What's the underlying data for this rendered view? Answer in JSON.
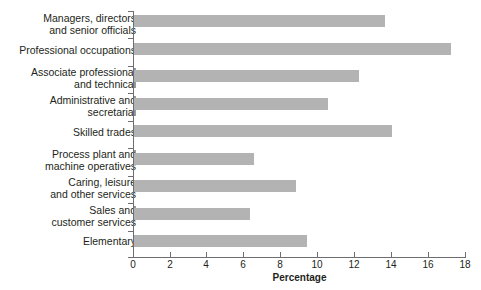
{
  "chart_data": {
    "type": "bar",
    "orientation": "horizontal",
    "title": "",
    "xlabel": "Percentage",
    "ylabel": "",
    "xlim": [
      0,
      18
    ],
    "xticks": [
      0,
      2,
      4,
      6,
      8,
      10,
      12,
      14,
      16,
      18
    ],
    "grid": false,
    "legend": null,
    "bar_color": "#b3b3b3",
    "axis_color": "#6d6e71",
    "categories": [
      "Managers, directors\nand senior officials",
      "Professional occupations",
      "Associate professional\nand technical",
      "Administrative and\nsecretarial",
      "Skilled trades",
      "Process plant and\nmachine operatives",
      "Caring, leisure\nand other services",
      "Sales and\ncustomer services",
      "Elementary"
    ],
    "values": [
      13.6,
      17.2,
      12.2,
      10.5,
      14.0,
      6.5,
      8.8,
      6.3,
      9.4
    ]
  },
  "labels": {
    "cat0_line1": "Managers, directors",
    "cat0_line2": "and senior officials",
    "cat1_line1": "Professional occupations",
    "cat1_line2": "",
    "cat2_line1": "Associate professional",
    "cat2_line2": "and technical",
    "cat3_line1": "Administrative and",
    "cat3_line2": "secretarial",
    "cat4_line1": "Skilled trades",
    "cat4_line2": "",
    "cat5_line1": "Process plant and",
    "cat5_line2": "machine operatives",
    "cat6_line1": "Caring, leisure",
    "cat6_line2": "and other services",
    "cat7_line1": "Sales and",
    "cat7_line2": "customer services",
    "cat8_line1": "Elementary",
    "cat8_line2": ""
  },
  "xticklabels": {
    "t0": "0",
    "t1": "2",
    "t2": "4",
    "t3": "6",
    "t4": "8",
    "t5": "10",
    "t6": "12",
    "t7": "14",
    "t8": "16",
    "t9": "18"
  },
  "axis_title": "Percentage",
  "title_remnant": ""
}
